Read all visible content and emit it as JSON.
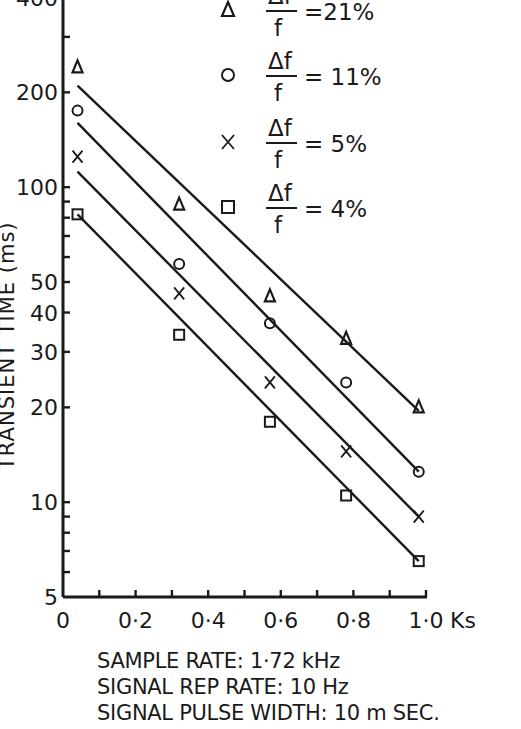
{
  "chart_data": {
    "type": "scatter",
    "title": "",
    "xlabel": "Ks",
    "ylabel": "TRANSIENT TIME (ms)",
    "xscale": "linear",
    "yscale": "log",
    "xlim": [
      0,
      1.0
    ],
    "ylim": [
      5,
      400
    ],
    "x_ticks": [
      "0",
      "0·2",
      "0·4",
      "0·6",
      "0·8",
      "1·0"
    ],
    "x_tick_values": [
      0,
      0.2,
      0.4,
      0.6,
      0.8,
      1.0
    ],
    "y_ticks": [
      "5",
      "10",
      "20",
      "30",
      "40",
      "50",
      "100",
      "200",
      "400"
    ],
    "y_tick_values": [
      5,
      10,
      20,
      30,
      40,
      50,
      100,
      200,
      400
    ],
    "grid": false,
    "legend_position": "top-right",
    "series": [
      {
        "name": "Δf/f = 21%",
        "marker": "triangle",
        "x": [
          0.04,
          0.32,
          0.57,
          0.78,
          0.98
        ],
        "y": [
          240,
          88,
          45,
          33,
          20
        ],
        "fit_line": {
          "x": [
            0.04,
            0.98
          ],
          "y": [
            210,
            19.5
          ]
        }
      },
      {
        "name": "Δf/f = 11%",
        "marker": "circle",
        "x": [
          0.04,
          0.32,
          0.57,
          0.78,
          0.98
        ],
        "y": [
          175,
          57,
          37,
          24,
          12.5
        ],
        "fit_line": {
          "x": [
            0.04,
            0.98
          ],
          "y": [
            160,
            12.5
          ]
        }
      },
      {
        "name": "Δf/f = 5%",
        "marker": "cross",
        "x": [
          0.04,
          0.32,
          0.57,
          0.78,
          0.98
        ],
        "y": [
          125,
          46,
          24,
          14.5,
          9
        ],
        "fit_line": {
          "x": [
            0.04,
            0.98
          ],
          "y": [
            112,
            9
          ]
        }
      },
      {
        "name": "Δf/f = 4%",
        "marker": "square",
        "x": [
          0.04,
          0.32,
          0.57,
          0.78,
          0.98
        ],
        "y": [
          82,
          34,
          18,
          10.5,
          6.5
        ],
        "fit_line": {
          "x": [
            0.04,
            0.98
          ],
          "y": [
            82,
            6.5
          ]
        }
      }
    ],
    "annotations": [
      "SAMPLE RATE: 1·72 kHz",
      "SIGNAL REP RATE: 10 Hz",
      "SIGNAL PULSE WIDTH: 10 m SEC."
    ]
  },
  "axes": {
    "ylabel": "TRANSIENT TIME (ms)",
    "x_unit": "Ks"
  },
  "legend": [
    {
      "marker": "triangle",
      "numerator": "Δf",
      "denominator": "f",
      "value": "=21%"
    },
    {
      "marker": "circle",
      "numerator": "Δf",
      "denominator": "f",
      "value": "= 11%"
    },
    {
      "marker": "cross",
      "numerator": "Δf",
      "denominator": "f",
      "value": "= 5%"
    },
    {
      "marker": "square",
      "numerator": "Δf",
      "denominator": "f",
      "value": "= 4%"
    }
  ],
  "notes": {
    "sample_rate": "SAMPLE RATE: 1·72 kHz",
    "rep_rate": "SIGNAL REP RATE: 10 Hz",
    "pulse_width": "SIGNAL PULSE WIDTH: 10 m SEC."
  },
  "colors": {
    "ink": "#1a1a1a",
    "background": "#ffffff"
  }
}
